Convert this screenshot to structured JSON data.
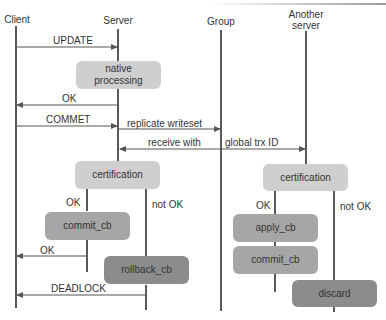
{
  "participants": {
    "client": "Client",
    "server": "Server",
    "group": "Group",
    "another_server_line1": "Another",
    "another_server_line2": "server"
  },
  "messages": {
    "update": "UPDATE",
    "ok_1": "OK",
    "commet": "COMMET",
    "replicate_writeset": "replicate writeset",
    "receive_with": "receive with",
    "global_trx_id": "global trx ID",
    "ok_2": "OK",
    "deadlock": "DEADLOCK"
  },
  "boxes": {
    "native_processing_line1": "native",
    "native_processing_line2": "processing",
    "certification_server": "certification",
    "commit_cb_server": "commit_cb",
    "rollback_cb": "rollback_cb",
    "certification_another": "certification",
    "apply_cb": "apply_cb",
    "commit_cb_another": "commit_cb",
    "discard": "discard"
  },
  "branch_labels": {
    "server_ok": "OK",
    "server_not_ok": "not OK",
    "another_ok": "OK",
    "another_not_ok": "not OK"
  },
  "colors": {
    "box_light": "#cfcfcf",
    "box_mid": "#a6a6a6",
    "box_dark": "#8c8c8c",
    "line": "#222222",
    "arrow": "#555555"
  }
}
